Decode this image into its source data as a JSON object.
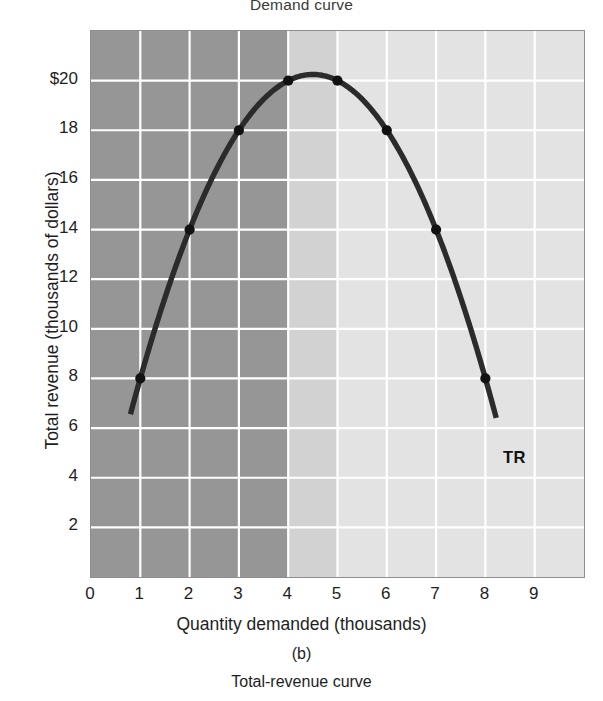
{
  "figure": {
    "top_caption": "Demand curve",
    "panel_label": "(b)",
    "bottom_caption": "Total-revenue curve",
    "series_label": "TR"
  },
  "colors": {
    "band_dark": "#969696",
    "band_medium": "#d2d2d2",
    "band_light": "#e3e3e3",
    "gridline": "#ffffff",
    "curve": "#2b2b2b",
    "frame": "#8e8e8e",
    "text": "#1e1e1e"
  },
  "chart_data": {
    "type": "line",
    "title": "Total-revenue curve",
    "xlabel": "Quantity demanded (thousands)",
    "ylabel": "Total revenue (thousands of dollars)",
    "xlim": [
      0,
      10
    ],
    "ylim": [
      0,
      22
    ],
    "grid": true,
    "legend": "none",
    "xticks": [
      0,
      1,
      2,
      3,
      4,
      5,
      6,
      7,
      8,
      9
    ],
    "xticklabels": [
      "0",
      "1",
      "2",
      "3",
      "4",
      "5",
      "6",
      "7",
      "8",
      "9"
    ],
    "yticks": [
      2,
      4,
      6,
      8,
      10,
      12,
      14,
      16,
      18,
      20
    ],
    "yticklabels": [
      "2",
      "4",
      "6",
      "8",
      "10",
      "12",
      "14",
      "16",
      "18",
      "$20"
    ],
    "series": [
      {
        "name": "TR",
        "marked_points": [
          {
            "x": 1,
            "y": 8
          },
          {
            "x": 2,
            "y": 14
          },
          {
            "x": 3,
            "y": 18
          },
          {
            "x": 4,
            "y": 20
          },
          {
            "x": 5,
            "y": 20
          },
          {
            "x": 6,
            "y": 18
          },
          {
            "x": 7,
            "y": 14
          },
          {
            "x": 8,
            "y": 8
          }
        ],
        "curve_start": {
          "x": 0.8,
          "y": 5.0
        },
        "curve_end": {
          "x": 8.22,
          "y": 5.0
        }
      }
    ],
    "shaded_bands": [
      {
        "name": "elastic-region",
        "x_from": 0,
        "x_to": 4,
        "color": "#969696"
      },
      {
        "name": "unit-elastic-region",
        "x_from": 4,
        "x_to": 5,
        "color": "#d2d2d2"
      },
      {
        "name": "inelastic-region",
        "x_from": 5,
        "x_to": 10,
        "color": "#e3e3e3"
      }
    ]
  }
}
